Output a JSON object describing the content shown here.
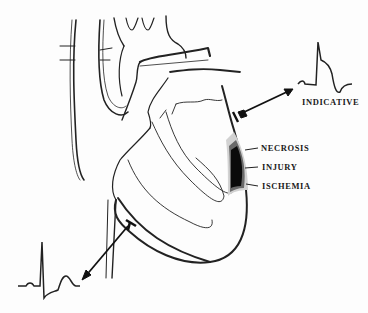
{
  "diagram": {
    "labels": {
      "indicative": "INDICATIVE",
      "necrosis": "NECROSIS",
      "injury": "INJURY",
      "ischemia": "ISCHEMIA"
    },
    "zones": [
      {
        "name": "necrosis",
        "color": "#0a0a0a"
      },
      {
        "name": "injury",
        "color": "#555555"
      },
      {
        "name": "ischemia",
        "color": "#cfcfcf"
      }
    ],
    "ecg": [
      {
        "name": "indicative",
        "st_segment": "elevated",
        "t_wave": "inverted"
      },
      {
        "name": "reciprocal",
        "st_segment": "depressed",
        "t_wave": "upright"
      }
    ]
  }
}
